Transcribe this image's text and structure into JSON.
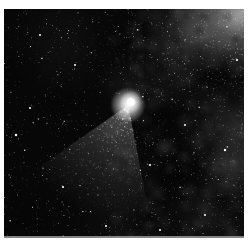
{
  "photo": {
    "alt": "Black-and-white photograph of a comet with a bright white coma and a broad grainy dust tail fanning toward the lower left, against a dense Milky Way star field with bright star clouds and dark nebula patches in the upper right",
    "margin_color": "#ffffff"
  },
  "scene": {
    "width": 240,
    "height": 229,
    "seed": 1986,
    "base_color": "#070707",
    "glow_blobs": [
      {
        "x": 230,
        "y": 8,
        "r": 62,
        "gray": 205,
        "alpha": 0.5
      },
      {
        "x": 238,
        "y": 4,
        "r": 26,
        "gray": 235,
        "alpha": 0.45
      },
      {
        "x": 186,
        "y": 22,
        "r": 46,
        "gray": 170,
        "alpha": 0.22
      },
      {
        "x": 232,
        "y": 118,
        "r": 55,
        "gray": 160,
        "alpha": 0.2
      },
      {
        "x": 228,
        "y": 160,
        "r": 32,
        "gray": 175,
        "alpha": 0.2
      },
      {
        "x": 205,
        "y": 205,
        "r": 45,
        "gray": 150,
        "alpha": 0.1
      },
      {
        "x": 165,
        "y": 60,
        "r": 48,
        "gray": 145,
        "alpha": 0.1
      },
      {
        "x": 118,
        "y": 75,
        "r": 26,
        "gray": 150,
        "alpha": 0.08
      },
      {
        "x": 60,
        "y": 35,
        "r": 55,
        "gray": 125,
        "alpha": 0.07
      },
      {
        "x": 120,
        "y": 212,
        "r": 55,
        "gray": 120,
        "alpha": 0.06
      }
    ],
    "mottle": {
      "count": 150,
      "x_min": 108,
      "x_max": 240,
      "r_min": 3,
      "r_max": 11,
      "gray_min": 140,
      "gray_max": 210,
      "alpha_min": 0.03,
      "alpha_max": 0.1
    },
    "dark_patches": [
      {
        "x": 216,
        "y": 62,
        "r": 27,
        "alpha": 0.55
      },
      {
        "x": 230,
        "y": 88,
        "r": 20,
        "alpha": 0.45
      },
      {
        "x": 196,
        "y": 44,
        "r": 14,
        "alpha": 0.35
      },
      {
        "x": 160,
        "y": 108,
        "r": 25,
        "alpha": 0.45
      },
      {
        "x": 172,
        "y": 168,
        "r": 28,
        "alpha": 0.32
      },
      {
        "x": 220,
        "y": 190,
        "r": 16,
        "alpha": 0.35
      },
      {
        "x": 145,
        "y": 205,
        "r": 26,
        "alpha": 0.28
      },
      {
        "x": 90,
        "y": 55,
        "r": 22,
        "alpha": 0.2
      },
      {
        "x": 20,
        "y": 210,
        "r": 40,
        "alpha": 0.28
      },
      {
        "x": 15,
        "y": 60,
        "r": 30,
        "alpha": 0.22
      },
      {
        "x": 60,
        "y": 95,
        "r": 26,
        "alpha": 0.22
      },
      {
        "x": 95,
        "y": 28,
        "r": 24,
        "alpha": 0.18
      }
    ],
    "dark_speckle": {
      "count": 55,
      "x_min": 135,
      "x_max": 240,
      "r_min": 3,
      "r_max": 9,
      "alpha_min": 0.1,
      "alpha_max": 0.3
    },
    "star_layers": [
      {
        "pass": 1,
        "region": "full",
        "count": 1500,
        "size_min": 0.3,
        "size_max": 0.9,
        "alpha_min": 0.12,
        "alpha_max": 1.0
      },
      {
        "pass": 2,
        "region": "right",
        "count": 650,
        "size_min": 0.3,
        "size_max": 0.8,
        "alpha_min": 0.15,
        "alpha_max": 0.9
      },
      {
        "pass": 2,
        "region": "topright",
        "count": 240,
        "size_min": 0.3,
        "size_max": 0.8,
        "alpha_min": 0.2,
        "alpha_max": 0.95
      },
      {
        "pass": 2,
        "region": "full",
        "count": 26,
        "size_min": 0.9,
        "size_max": 1.4,
        "alpha_min": 0.75,
        "alpha_max": 1.0
      }
    ],
    "named_stars": [
      {
        "x": 12,
        "y": 126,
        "r": 1.2
      },
      {
        "x": 26,
        "y": 99,
        "r": 1.0
      },
      {
        "x": 59,
        "y": 178,
        "r": 1.1
      },
      {
        "x": 102,
        "y": 217,
        "r": 1.0
      },
      {
        "x": 146,
        "y": 156,
        "r": 1.1
      },
      {
        "x": 181,
        "y": 116,
        "r": 1.0
      },
      {
        "x": 221,
        "y": 141,
        "r": 1.2
      },
      {
        "x": 201,
        "y": 206,
        "r": 1.0
      },
      {
        "x": 233,
        "y": 51,
        "r": 1.1
      },
      {
        "x": 71,
        "y": 56,
        "r": 1.0
      },
      {
        "x": 156,
        "y": 221,
        "r": 1.0
      },
      {
        "x": 36,
        "y": 26,
        "r": 1.0
      }
    ],
    "grain": {
      "count": 2400,
      "size_min": 0.4,
      "size_max": 0.8,
      "alpha_min": 0.03,
      "alpha_max": 0.1
    },
    "comet": {
      "x": 124,
      "y": 96,
      "core_dx": 3,
      "core_dy": -3,
      "core_r": 6,
      "coma_r": 18,
      "tail_angle_deg": 112,
      "tail_half_deg": 33,
      "tail_len": 115,
      "tail_alpha": 0.3,
      "speck_count": 540
    },
    "bottom_strip": {
      "height": 2,
      "gray": 160,
      "alpha": 0.8
    }
  }
}
